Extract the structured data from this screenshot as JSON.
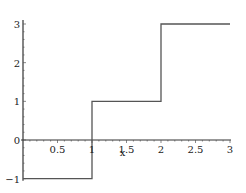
{
  "chart_data": {
    "type": "line",
    "title": "",
    "xlabel": "x",
    "ylabel": "",
    "xlim": [
      0,
      3
    ],
    "ylim": [
      -1,
      3
    ],
    "grid": false,
    "legend": null,
    "x_ticks": [
      "0.5",
      "1",
      "1.5",
      "2",
      "2.5",
      "3"
    ],
    "x_tick_values": [
      0.5,
      1,
      1.5,
      2,
      2.5,
      3
    ],
    "y_ticks": [
      "-1",
      "0",
      "1",
      "2",
      "3"
    ],
    "y_tick_values": [
      -1,
      0,
      1,
      2,
      3
    ],
    "series": [
      {
        "name": "step function",
        "color": "#555555",
        "points": [
          [
            0,
            -1
          ],
          [
            1,
            -1
          ],
          [
            1,
            1
          ],
          [
            2,
            1
          ],
          [
            2,
            3
          ],
          [
            3,
            3
          ]
        ]
      }
    ]
  }
}
